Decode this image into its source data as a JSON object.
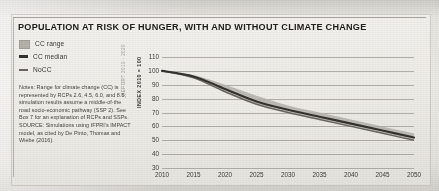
{
  "figure": {
    "title": "POPULATION AT RISK OF HUNGER, WITH AND WITHOUT CLIMATE CHANGE",
    "side_caption": "REPORT 2019 - 2020"
  },
  "legend": {
    "position": "top-left",
    "items": [
      {
        "label": "CC range",
        "marker": "square",
        "color": "#b4b1ab",
        "name": "legend-cc-range"
      },
      {
        "label": "CC median",
        "marker": "line",
        "color": "#34322f",
        "name": "legend-cc-median"
      },
      {
        "label": "NoCC",
        "marker": "line",
        "color": "#6a6762",
        "name": "legend-nocc"
      }
    ]
  },
  "notes": {
    "text": "Notes: Range for climate change (CC) is represented by RCPs 2.6, 4.5, 6.0, and 8.5; simulation results assume a middle-of-the road socio-economic pathway (SSP 2). See Box 7 for an explanation of RCPs and SSPs. SOURCE: Simulations using IFPRI's IMPACT model, as cited by De Pinto, Thomas and Wiebe (2016)."
  },
  "chart_data": {
    "type": "line",
    "title": "POPULATION AT RISK OF HUNGER, WITH AND WITHOUT CLIMATE CHANGE",
    "xlabel": "",
    "ylabel": "INDEX 2010 = 100",
    "xlim": [
      2010,
      2050
    ],
    "ylim": [
      30,
      110
    ],
    "ytick_step": 10,
    "xtick_step": 5,
    "grid": true,
    "x": [
      2010,
      2015,
      2020,
      2025,
      2030,
      2035,
      2040,
      2045,
      2050
    ],
    "xticks": [
      "2010",
      "2015",
      "2020",
      "2025",
      "2030",
      "2035",
      "2040",
      "2045",
      "2050"
    ],
    "yticks": [
      "110",
      "100",
      "90",
      "80",
      "70",
      "60",
      "50",
      "40",
      "30"
    ],
    "ytick_values": [
      110,
      100,
      90,
      80,
      70,
      60,
      50,
      40,
      30
    ],
    "series": [
      {
        "name": "CC median",
        "color": "#34322f",
        "values": [
          100,
          96,
          87,
          78,
          72,
          67,
          62,
          57,
          52
        ]
      },
      {
        "name": "NoCC",
        "color": "#6a6762",
        "values": [
          100,
          95,
          85,
          76,
          70,
          65,
          60,
          55,
          50
        ]
      }
    ],
    "band": {
      "name": "CC range",
      "color": "#b4b1ab",
      "upper": [
        100,
        97,
        90,
        82,
        75,
        70,
        65,
        60,
        55
      ],
      "lower": [
        100,
        95,
        85,
        76,
        70,
        65,
        60,
        55,
        50
      ]
    }
  }
}
